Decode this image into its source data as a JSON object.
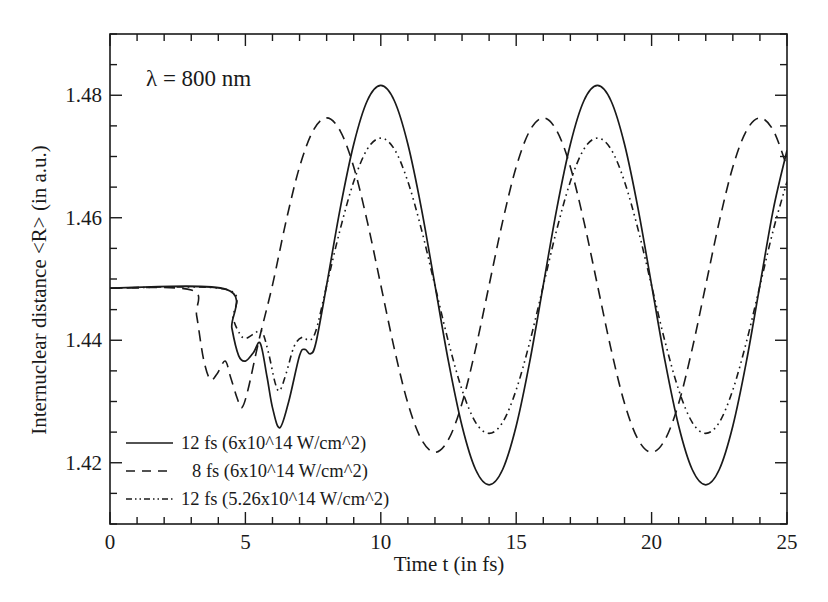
{
  "chart_data": {
    "type": "line",
    "title": "",
    "annotation": "λ = 800 nm",
    "xlabel": "Time t (in fs)",
    "ylabel": "Internuclear distance <R> (in a.u.)",
    "xlim": [
      0,
      25
    ],
    "ylim": [
      1.41,
      1.49
    ],
    "xticks": [
      0,
      5,
      10,
      15,
      20,
      25
    ],
    "xtick_labels": [
      "0",
      "5",
      "10",
      "15",
      "20",
      "25"
    ],
    "x_minor_step": 1,
    "yticks": [
      1.42,
      1.44,
      1.46,
      1.48
    ],
    "ytick_labels": [
      "1.42",
      "1.44",
      "1.46",
      "1.48"
    ],
    "y_minor_step": 0.005,
    "grid": false,
    "legend_position": "lower left",
    "series": [
      {
        "name": "12 fs (6x10^14 W/cm^2)",
        "style": "solid",
        "color": "#1a1a1a",
        "x": [
          0,
          4.3,
          4.5,
          4.75,
          5.0,
          5.3,
          5.55,
          5.8,
          6.0,
          6.27,
          6.6,
          7.0,
          7.2,
          7.4,
          7.6,
          8,
          8.5,
          9,
          9.5,
          10,
          10.5,
          11,
          11.5,
          12,
          12.5,
          13,
          13.5,
          14,
          14.5,
          15,
          15.5,
          16,
          16.5,
          17,
          17.5,
          18,
          18.5,
          19,
          19.5,
          20,
          20.5,
          21,
          21.5,
          22,
          22.5,
          23,
          23.5,
          24,
          24.5,
          25
        ],
        "y": [
          1.4485,
          1.4483,
          1.442,
          1.4375,
          1.4366,
          1.438,
          1.4395,
          1.434,
          1.429,
          1.4257,
          1.43,
          1.4375,
          1.4385,
          1.4378,
          1.4395,
          1.449,
          1.4615,
          1.472,
          1.4791,
          1.4816,
          1.4791,
          1.472,
          1.4615,
          1.449,
          1.4365,
          1.426,
          1.4189,
          1.4164,
          1.4189,
          1.426,
          1.4365,
          1.449,
          1.4615,
          1.472,
          1.4791,
          1.4816,
          1.4791,
          1.472,
          1.4615,
          1.449,
          1.4365,
          1.426,
          1.4189,
          1.4164,
          1.4189,
          1.426,
          1.4365,
          1.449,
          1.4615,
          1.471
        ]
      },
      {
        "name": "8 fs (6x10^14 W/cm^2)",
        "style": "dashed",
        "color": "#1a1a1a",
        "x": [
          0,
          3.0,
          3.2,
          3.45,
          3.7,
          3.95,
          4.25,
          4.45,
          4.7,
          4.87,
          5.1,
          5.5,
          6.0,
          6.5,
          7,
          7.5,
          8,
          8.5,
          9,
          9.5,
          10,
          10.5,
          11,
          11.5,
          12,
          12.5,
          13,
          13.5,
          14,
          14.5,
          15,
          15.5,
          16,
          16.5,
          17,
          17.5,
          18,
          18.5,
          19,
          19.5,
          20,
          20.5,
          21,
          21.5,
          22,
          22.5,
          23,
          23.5,
          24,
          24.5,
          25
        ],
        "y": [
          1.4485,
          1.4482,
          1.444,
          1.437,
          1.4336,
          1.4345,
          1.4366,
          1.434,
          1.4305,
          1.429,
          1.432,
          1.44,
          1.449,
          1.4594,
          1.4683,
          1.4742,
          1.4763,
          1.4742,
          1.4683,
          1.4594,
          1.449,
          1.4386,
          1.4297,
          1.4238,
          1.4217,
          1.4238,
          1.4297,
          1.4386,
          1.449,
          1.4594,
          1.4683,
          1.4742,
          1.4763,
          1.4742,
          1.4683,
          1.4594,
          1.449,
          1.4386,
          1.4297,
          1.4238,
          1.4217,
          1.4238,
          1.4297,
          1.4386,
          1.449,
          1.4594,
          1.4683,
          1.4742,
          1.4763,
          1.4742,
          1.4683
        ]
      },
      {
        "name": "12 fs (5.26x10^14 W/cm^2)",
        "style": "dash-dot-dot",
        "color": "#1a1a1a",
        "x": [
          0,
          4.3,
          4.55,
          4.8,
          5.0,
          5.3,
          5.6,
          5.85,
          6.1,
          6.27,
          6.5,
          6.8,
          7.1,
          7.35,
          7.6,
          8,
          8.5,
          9,
          9.5,
          10,
          10.5,
          11,
          11.5,
          12,
          12.5,
          13,
          13.5,
          14,
          14.5,
          15,
          15.5,
          16,
          16.5,
          17,
          17.5,
          18,
          18.5,
          19,
          19.5,
          20,
          20.5,
          21,
          21.5,
          22,
          22.5,
          23,
          23.5,
          24,
          24.5,
          25
        ],
        "y": [
          1.4485,
          1.4483,
          1.4435,
          1.441,
          1.4403,
          1.441,
          1.4415,
          1.438,
          1.433,
          1.4318,
          1.4345,
          1.439,
          1.4405,
          1.44,
          1.4415,
          1.4489,
          1.4581,
          1.4659,
          1.4712,
          1.473,
          1.4712,
          1.4659,
          1.4581,
          1.4489,
          1.4397,
          1.4319,
          1.4266,
          1.4248,
          1.4266,
          1.4319,
          1.4397,
          1.4489,
          1.4581,
          1.4659,
          1.4712,
          1.473,
          1.4712,
          1.4659,
          1.4581,
          1.4489,
          1.4397,
          1.4319,
          1.4266,
          1.4248,
          1.4266,
          1.4319,
          1.4397,
          1.4489,
          1.4581,
          1.4659
        ]
      }
    ]
  },
  "layout": {
    "plot_left": 110,
    "plot_right": 787,
    "plot_top": 34,
    "plot_bottom": 524
  }
}
